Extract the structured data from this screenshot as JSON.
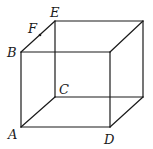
{
  "figure": {
    "type": "cube-wireframe",
    "labels": {
      "A": "A",
      "B": "B",
      "C": "C",
      "D": "D",
      "E": "E",
      "F": "F"
    },
    "vertices": {
      "A": [
        21,
        127
      ],
      "B": [
        21,
        52
      ],
      "C": [
        55,
        97
      ],
      "D": [
        110,
        127
      ],
      "E": [
        55,
        21
      ],
      "front_top_right": [
        110,
        52
      ],
      "back_top_right": [
        143,
        21
      ],
      "back_bottom_right": [
        143,
        97
      ]
    },
    "points": {
      "F": [
        40,
        35
      ]
    },
    "note": "F lies on edge BE"
  }
}
